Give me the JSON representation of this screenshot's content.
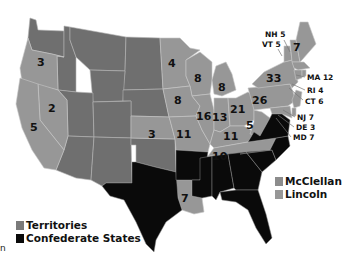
{
  "map": {
    "title": "1864 United States presidential election",
    "colors": {
      "territories": "#6f6f6f",
      "lincoln": "#979797",
      "mcclellan": "#8c8c8c",
      "confederate": "#0a0a0a"
    },
    "states": [
      {
        "id": "OR",
        "electoral_votes": "3",
        "party": "lincoln"
      },
      {
        "id": "NV",
        "electoral_votes": "2",
        "party": "lincoln"
      },
      {
        "id": "CA",
        "electoral_votes": "5",
        "party": "lincoln"
      },
      {
        "id": "MN",
        "electoral_votes": "4",
        "party": "lincoln"
      },
      {
        "id": "WI",
        "electoral_votes": "8",
        "party": "lincoln"
      },
      {
        "id": "MI",
        "electoral_votes": "8",
        "party": "lincoln"
      },
      {
        "id": "IA",
        "electoral_votes": "8",
        "party": "lincoln"
      },
      {
        "id": "KS",
        "electoral_votes": "3",
        "party": "lincoln"
      },
      {
        "id": "MO",
        "electoral_votes": "11",
        "party": "lincoln"
      },
      {
        "id": "IL",
        "electoral_votes": "16",
        "party": "lincoln"
      },
      {
        "id": "IN",
        "electoral_votes": "13",
        "party": "lincoln"
      },
      {
        "id": "OH",
        "electoral_votes": "21",
        "party": "lincoln"
      },
      {
        "id": "KY",
        "electoral_votes": "11",
        "party": "mcclellan"
      },
      {
        "id": "WV",
        "electoral_votes": "5",
        "party": "lincoln"
      },
      {
        "id": "PA",
        "electoral_votes": "26",
        "party": "lincoln"
      },
      {
        "id": "NY",
        "electoral_votes": "33",
        "party": "lincoln"
      },
      {
        "id": "ME",
        "electoral_votes": "7",
        "party": "lincoln"
      },
      {
        "id": "TN",
        "electoral_votes": "10",
        "party": "lincoln"
      },
      {
        "id": "LA",
        "electoral_votes": "7",
        "party": "lincoln"
      }
    ],
    "callouts": [
      {
        "label": "NH 5"
      },
      {
        "label": "VT 5"
      },
      {
        "label": "MA 12"
      },
      {
        "label": "RI 4"
      },
      {
        "label": "CT 6"
      },
      {
        "label": "NJ 7"
      },
      {
        "label": "DE 3"
      },
      {
        "label": "MD 7"
      }
    ]
  },
  "legend": {
    "right": [
      {
        "label": "McClellan",
        "color": "#8c8c8c"
      },
      {
        "label": "Lincoln",
        "color": "#979797"
      }
    ],
    "left": [
      {
        "label": "Territories",
        "color": "#7a7a7a"
      },
      {
        "label": "Confederate States",
        "color": "#0a0a0a"
      }
    ]
  },
  "stray_text": "n"
}
